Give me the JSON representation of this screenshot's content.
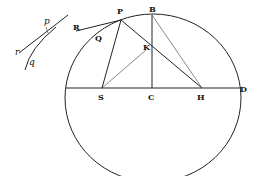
{
  "diagram": {
    "title": "",
    "type": "geometric-figure",
    "points": {
      "P": {
        "label": "P",
        "x": 121,
        "y": 18
      },
      "B": {
        "label": "B",
        "x": 152,
        "y": 15
      },
      "K": {
        "label": "K",
        "x": 147,
        "y": 47
      },
      "S": {
        "label": "S",
        "x": 102,
        "y": 88
      },
      "C": {
        "label": "C",
        "x": 152,
        "y": 88
      },
      "H": {
        "label": "H",
        "x": 202,
        "y": 88
      },
      "D": {
        "label": "D",
        "x": 240,
        "y": 88
      },
      "R": {
        "label": "R",
        "x": 76,
        "y": 28
      },
      "Q": {
        "label": "Q",
        "x": 98,
        "y": 39
      }
    },
    "inset": {
      "labels": {
        "p": "p",
        "q": "q",
        "r": "r"
      }
    },
    "labels": {
      "P": "P",
      "B": "B",
      "K": "K",
      "S": "S",
      "C": "C",
      "H": "H",
      "D": "D",
      "R": "R",
      "Q": "Q",
      "p": "p",
      "q": "q",
      "r": "r"
    }
  }
}
